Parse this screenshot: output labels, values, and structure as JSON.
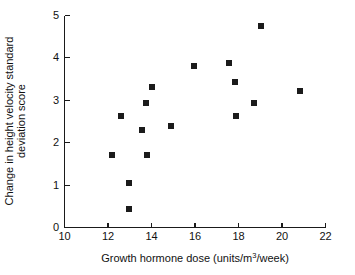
{
  "chart_data": {
    "type": "scatter",
    "title": "",
    "xlabel": "Growth hormone dose (units/m3/week)",
    "xlabel_parts": {
      "before": "Growth hormone dose (units/m",
      "superscript": "3",
      "after": "/week)"
    },
    "ylabel_line1": "Change in height velocity standard",
    "ylabel_line2": "deviation score",
    "xlim": [
      10,
      22
    ],
    "ylim": [
      0,
      5
    ],
    "xticks": [
      10,
      12,
      14,
      16,
      18,
      20,
      22
    ],
    "yticks": [
      0,
      1,
      2,
      3,
      4,
      5
    ],
    "xtick_labels": [
      "10",
      "12",
      "14",
      "16",
      "18",
      "20",
      "22"
    ],
    "ytick_labels": [
      "0",
      "1",
      "2",
      "3",
      "4",
      "5"
    ],
    "grid": false,
    "legend": false,
    "marker": "square",
    "marker_color": "#1b1b1b",
    "marker_size": 6,
    "points": [
      {
        "x": 12.2,
        "y": 1.72
      },
      {
        "x": 12.6,
        "y": 2.62
      },
      {
        "x": 12.95,
        "y": 1.05
      },
      {
        "x": 12.95,
        "y": 0.44
      },
      {
        "x": 13.55,
        "y": 2.29
      },
      {
        "x": 13.75,
        "y": 2.93
      },
      {
        "x": 13.8,
        "y": 1.71
      },
      {
        "x": 14.0,
        "y": 3.31
      },
      {
        "x": 14.9,
        "y": 2.39
      },
      {
        "x": 15.95,
        "y": 3.81
      },
      {
        "x": 17.55,
        "y": 3.88
      },
      {
        "x": 17.85,
        "y": 3.42
      },
      {
        "x": 17.9,
        "y": 2.63
      },
      {
        "x": 18.7,
        "y": 2.94
      },
      {
        "x": 19.05,
        "y": 4.75
      },
      {
        "x": 20.85,
        "y": 3.23
      }
    ]
  },
  "axes": {
    "x_axis_name": "x-axis",
    "y_axis_name": "y-axis"
  }
}
